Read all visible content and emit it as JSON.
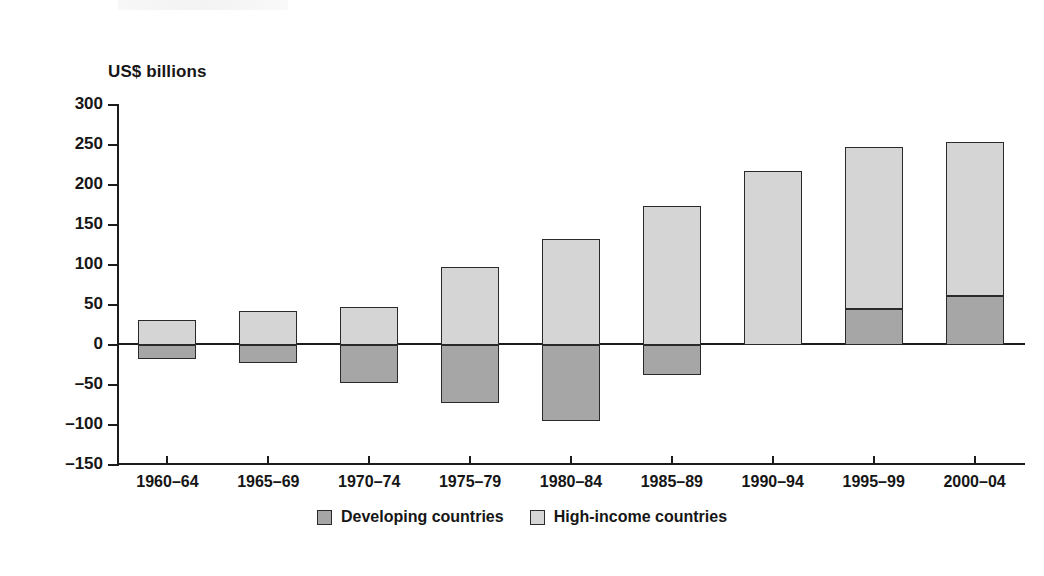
{
  "chart_data": {
    "type": "bar",
    "title": "",
    "subtitle": "",
    "xlabel": "",
    "ylabel": "US$ billions",
    "ylim": [
      -150,
      300
    ],
    "ytick_step": 50,
    "grid": false,
    "stacked": true,
    "legend_position": "bottom-center",
    "categories": [
      "1960–64",
      "1965–69",
      "1970–74",
      "1975–79",
      "1980–84",
      "1985–89",
      "1990–94",
      "1995–99",
      "2000–04"
    ],
    "yticks": [
      "300",
      "250",
      "200",
      "150",
      "100",
      "50",
      "0",
      "–50",
      "–100",
      "–150"
    ],
    "ytick_values": [
      300,
      250,
      200,
      150,
      100,
      50,
      0,
      -50,
      -100,
      -150
    ],
    "series": [
      {
        "name": "Developing countries",
        "color": "#a6a6a6",
        "values": [
          -18,
          -22,
          -48,
          -72,
          -95,
          -38,
          0,
          45,
          61
        ]
      },
      {
        "name": "High-income countries",
        "color": "#d5d5d5",
        "values": [
          31,
          42,
          48,
          97,
          133,
          174,
          217,
          247,
          254
        ]
      }
    ]
  },
  "axis": {
    "y_title": "US$ billions"
  },
  "legend": {
    "items": [
      {
        "label": "Developing countries",
        "swatch": "swatch-dark"
      },
      {
        "label": "High-income countries",
        "swatch": "swatch-light"
      }
    ]
  }
}
